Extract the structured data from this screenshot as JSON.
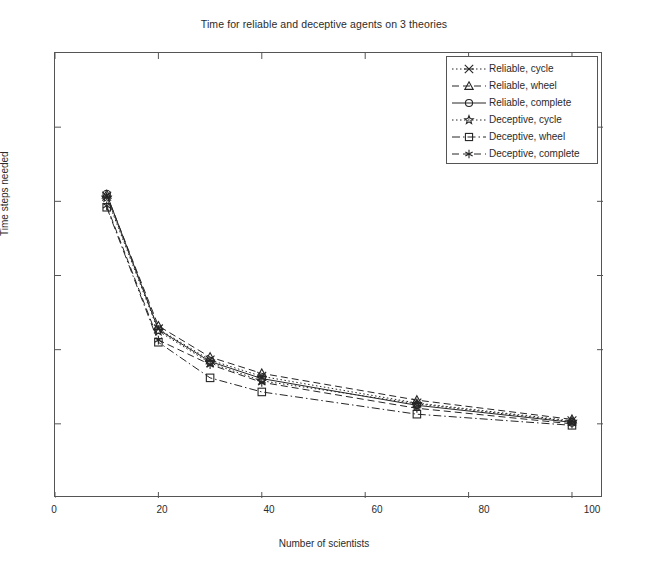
{
  "chart_data": {
    "type": "line",
    "title": "Time for reliable and deceptive agents on 3 theories",
    "xlabel": "Number of scientists",
    "ylabel": "Time steps needed",
    "x": [
      10,
      20,
      30,
      40,
      70,
      100
    ],
    "xlim": [
      0,
      106
    ],
    "xticks": [
      0,
      20,
      40,
      60,
      80,
      100
    ],
    "xtick_labels": [
      "0",
      "20",
      "40",
      "60",
      "80",
      "100"
    ],
    "ylim": [
      0,
      6
    ],
    "yticks": [
      1,
      2,
      3,
      4,
      5
    ],
    "ytick_labels": [
      "",
      "",
      "",
      "",
      ""
    ],
    "grid": false,
    "legend_position": "upper right",
    "series": [
      {
        "name": "Reliable, cycle",
        "marker": "x-cross-marker",
        "linestyle": "dotted",
        "values": [
          4.07,
          2.28,
          1.86,
          1.64,
          1.28,
          1.04
        ]
      },
      {
        "name": "Reliable, wheel",
        "marker": "triangle-marker",
        "linestyle": "dashed",
        "values": [
          4.09,
          2.32,
          1.9,
          1.68,
          1.32,
          1.06
        ]
      },
      {
        "name": "Reliable, complete",
        "marker": "circle-marker",
        "linestyle": "solid",
        "values": [
          4.1,
          2.27,
          1.84,
          1.61,
          1.25,
          1.02
        ]
      },
      {
        "name": "Deceptive, cycle",
        "marker": "star-marker",
        "linestyle": "dotted",
        "values": [
          4.05,
          2.25,
          1.82,
          1.58,
          1.27,
          1.03
        ]
      },
      {
        "name": "Deceptive, wheel",
        "marker": "square-marker",
        "linestyle": "dash-dot",
        "values": [
          3.92,
          2.1,
          1.62,
          1.43,
          1.13,
          0.98
        ]
      },
      {
        "name": "Deceptive, complete",
        "marker": "asterisk-marker",
        "linestyle": "dashed",
        "values": [
          3.94,
          2.13,
          1.8,
          1.56,
          1.21,
          1.0
        ]
      }
    ]
  },
  "colors": {
    "line": "#262626",
    "axis": "#555555",
    "text": "#2b2b2b",
    "background": "#ffffff"
  }
}
